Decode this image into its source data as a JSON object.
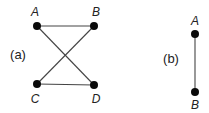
{
  "diagram": {
    "panels": [
      {
        "id": "a",
        "label": "(a)",
        "label_pos": [
          18,
          59
        ],
        "nodes": [
          {
            "id": "A",
            "label": "A",
            "x": 37,
            "y": 26,
            "lx": 35,
            "ly": 16
          },
          {
            "id": "B",
            "label": "B",
            "x": 94,
            "y": 26,
            "lx": 96,
            "ly": 16
          },
          {
            "id": "C",
            "label": "C",
            "x": 37,
            "y": 84,
            "lx": 35,
            "ly": 103
          },
          {
            "id": "D",
            "label": "D",
            "x": 94,
            "y": 85,
            "lx": 96,
            "ly": 103
          }
        ],
        "edges": [
          {
            "from": "A",
            "to": "B"
          },
          {
            "from": "A",
            "to": "D"
          },
          {
            "from": "B",
            "to": "C"
          },
          {
            "from": "C",
            "to": "D"
          }
        ]
      },
      {
        "id": "b",
        "label": "(b)",
        "label_pos": [
          171,
          63
        ],
        "nodes": [
          {
            "id": "A",
            "label": "A",
            "x": 195,
            "y": 34,
            "lx": 195,
            "ly": 25
          },
          {
            "id": "B",
            "label": "B",
            "x": 195,
            "y": 92,
            "lx": 195,
            "ly": 109
          }
        ],
        "edges": [
          {
            "from": "A",
            "to": "B"
          }
        ]
      }
    ],
    "colors": {
      "node": "#0a0a0a",
      "edge": "#444444",
      "text": "#222222",
      "background": "#ffffff"
    }
  }
}
